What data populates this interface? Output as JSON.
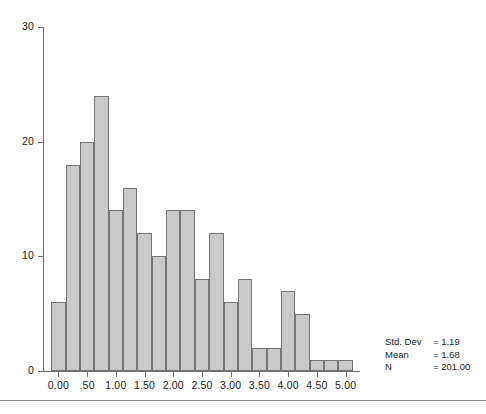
{
  "chart_data": {
    "type": "bar",
    "title": "",
    "subtitle": "",
    "xlabel": "",
    "ylabel": "",
    "grid": false,
    "legend_position": "none",
    "xlim": [
      -0.25,
      5.25
    ],
    "ylim": [
      0,
      30
    ],
    "bin_width": 0.25,
    "bin_starts": [
      -0.125,
      0.125,
      0.375,
      0.625,
      0.875,
      1.125,
      1.375,
      1.625,
      1.875,
      2.125,
      2.375,
      2.625,
      2.875,
      3.125,
      3.375,
      3.625,
      3.875,
      4.125,
      4.375,
      4.625,
      4.875
    ],
    "categories": [
      "-0.125",
      "0.125",
      "0.375",
      "0.625",
      "0.875",
      "1.125",
      "1.375",
      "1.625",
      "1.875",
      "2.125",
      "2.375",
      "2.625",
      "2.875",
      "3.125",
      "3.375",
      "3.625",
      "3.875",
      "4.125",
      "4.375",
      "4.625",
      "4.875"
    ],
    "values": [
      6,
      18,
      20,
      24,
      14,
      16,
      12,
      10,
      14,
      14,
      8,
      12,
      6,
      8,
      2,
      2,
      7,
      5,
      1,
      1,
      1
    ],
    "x_tick_values": [
      0.0,
      0.5,
      1.0,
      1.5,
      2.0,
      2.5,
      3.0,
      3.5,
      4.0,
      4.5,
      5.0
    ],
    "x_tick_labels": [
      "0.00",
      ".50",
      "1.00",
      "1.50",
      "2.00",
      "2.50",
      "3.00",
      "3.50",
      "4.00",
      "4.50",
      "5.00"
    ],
    "y_tick_values": [
      0,
      10,
      20,
      30
    ],
    "y_tick_labels": [
      "0",
      "10",
      "20",
      "30"
    ],
    "bar_fill_color": "#c9c9c9",
    "bar_border_color": "#757575",
    "axis_color": "#6e6e6e",
    "text_color": "#1a1a1a"
  },
  "stats": {
    "rows": [
      {
        "label": "Std. Dev",
        "value": "= 1.19"
      },
      {
        "label": "Mean",
        "value": "= 1.68"
      },
      {
        "label": "N",
        "value": "= 201.00"
      }
    ]
  }
}
